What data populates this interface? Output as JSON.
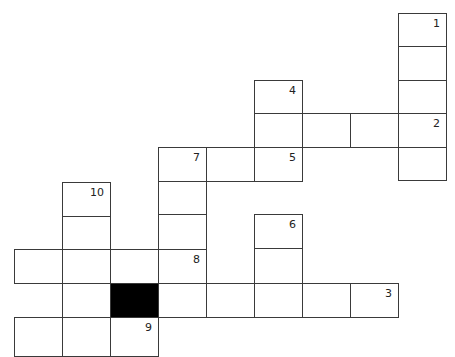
{
  "puzzle": {
    "type": "crossword",
    "colors": {
      "cell_fill": "#ffffff",
      "cell_border": "#3a3a3a",
      "block_fill": "#000000",
      "number_color": "#222222"
    },
    "cells": [
      {
        "x": 398,
        "y": 13,
        "w": 49,
        "h": 34,
        "num": "1",
        "black": false
      },
      {
        "x": 398,
        "y": 46,
        "w": 49,
        "h": 35,
        "num": "",
        "black": false
      },
      {
        "x": 398,
        "y": 80,
        "w": 49,
        "h": 34,
        "num": "",
        "black": false
      },
      {
        "x": 398,
        "y": 113,
        "w": 49,
        "h": 35,
        "num": "2",
        "black": false
      },
      {
        "x": 398,
        "y": 147,
        "w": 49,
        "h": 34,
        "num": "",
        "black": false
      },
      {
        "x": 254,
        "y": 80,
        "w": 49,
        "h": 34,
        "num": "4",
        "black": false
      },
      {
        "x": 254,
        "y": 113,
        "w": 49,
        "h": 35,
        "num": "",
        "black": false
      },
      {
        "x": 302,
        "y": 113,
        "w": 49,
        "h": 35,
        "num": "",
        "black": false
      },
      {
        "x": 350,
        "y": 113,
        "w": 49,
        "h": 35,
        "num": "",
        "black": false
      },
      {
        "x": 158,
        "y": 147,
        "w": 49,
        "h": 35,
        "num": "7",
        "black": false
      },
      {
        "x": 206,
        "y": 147,
        "w": 49,
        "h": 35,
        "num": "",
        "black": false
      },
      {
        "x": 254,
        "y": 147,
        "w": 49,
        "h": 35,
        "num": "5",
        "black": false
      },
      {
        "x": 158,
        "y": 181,
        "w": 49,
        "h": 34,
        "num": "",
        "black": false
      },
      {
        "x": 158,
        "y": 214,
        "w": 49,
        "h": 36,
        "num": "",
        "black": false
      },
      {
        "x": 158,
        "y": 249,
        "w": 49,
        "h": 35,
        "num": "8",
        "black": false
      },
      {
        "x": 254,
        "y": 214,
        "w": 49,
        "h": 35,
        "num": "6",
        "black": false
      },
      {
        "x": 254,
        "y": 248,
        "w": 49,
        "h": 36,
        "num": "",
        "black": false
      },
      {
        "x": 62,
        "y": 182,
        "w": 49,
        "h": 35,
        "num": "10",
        "black": false
      },
      {
        "x": 62,
        "y": 216,
        "w": 49,
        "h": 34,
        "num": "",
        "black": false
      },
      {
        "x": 14,
        "y": 249,
        "w": 49,
        "h": 35,
        "num": "",
        "black": false
      },
      {
        "x": 62,
        "y": 249,
        "w": 49,
        "h": 35,
        "num": "",
        "black": false
      },
      {
        "x": 110,
        "y": 249,
        "w": 49,
        "h": 35,
        "num": "",
        "black": false
      },
      {
        "x": 62,
        "y": 283,
        "w": 49,
        "h": 35,
        "num": "",
        "black": false
      },
      {
        "x": 110,
        "y": 283,
        "w": 49,
        "h": 35,
        "num": "",
        "black": true
      },
      {
        "x": 158,
        "y": 283,
        "w": 49,
        "h": 35,
        "num": "",
        "black": false
      },
      {
        "x": 206,
        "y": 283,
        "w": 49,
        "h": 35,
        "num": "",
        "black": false
      },
      {
        "x": 254,
        "y": 283,
        "w": 49,
        "h": 35,
        "num": "",
        "black": false
      },
      {
        "x": 302,
        "y": 283,
        "w": 49,
        "h": 35,
        "num": "",
        "black": false
      },
      {
        "x": 350,
        "y": 283,
        "w": 49,
        "h": 35,
        "num": "3",
        "black": false
      },
      {
        "x": 14,
        "y": 317,
        "w": 49,
        "h": 40,
        "num": "",
        "black": false
      },
      {
        "x": 62,
        "y": 317,
        "w": 49,
        "h": 40,
        "num": "",
        "black": false
      },
      {
        "x": 110,
        "y": 317,
        "w": 49,
        "h": 40,
        "num": "9",
        "black": false
      }
    ]
  }
}
